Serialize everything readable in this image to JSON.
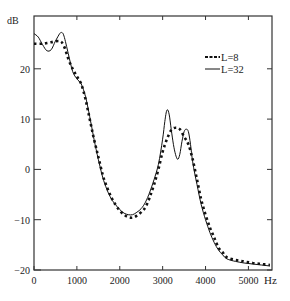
{
  "chart_data": {
    "type": "line",
    "title": "",
    "xlabel": "Hz",
    "ylabel": "dB",
    "xlim": [
      0,
      5550
    ],
    "ylim": [
      -20,
      30.5
    ],
    "x_ticks": [
      0,
      1000,
      2000,
      3000,
      4000,
      5000
    ],
    "x_tick_labels": [
      "0",
      "1000",
      "2000",
      "3000",
      "4000",
      "5000"
    ],
    "y_ticks": [
      -20,
      -10,
      0,
      10,
      20
    ],
    "y_tick_labels": [
      "-20",
      "-10",
      "0",
      "10",
      "20"
    ],
    "grid": false,
    "legend_position": "upper right",
    "series": [
      {
        "name": "L=8",
        "style": "dashed",
        "x": [
          0,
          200,
          400,
          600,
          700,
          800,
          900,
          1000,
          1100,
          1200,
          1300,
          1400,
          1500,
          1600,
          1700,
          1800,
          1900,
          2000,
          2100,
          2200,
          2300,
          2400,
          2500,
          2600,
          2700,
          2800,
          2900,
          3000,
          3100,
          3200,
          3300,
          3400,
          3500,
          3600,
          3700,
          3800,
          3900,
          4000,
          4100,
          4200,
          4300,
          4400,
          4500,
          4700,
          4900,
          5100,
          5300,
          5500
        ],
        "values": [
          25,
          25,
          25.3,
          25.5,
          24.5,
          22,
          20,
          18.5,
          17,
          14,
          10,
          6,
          2.5,
          -1,
          -3.5,
          -5.5,
          -7,
          -8.2,
          -9,
          -9.5,
          -9.6,
          -9.2,
          -8.5,
          -7.5,
          -5.5,
          -3,
          0,
          3.5,
          6,
          7.8,
          8.3,
          8,
          6.5,
          5,
          2,
          -2,
          -6,
          -9,
          -11.5,
          -13.5,
          -15.5,
          -16.5,
          -17.5,
          -18,
          -18.3,
          -18.6,
          -18.8,
          -19
        ]
      },
      {
        "name": "L=32",
        "style": "solid",
        "x": [
          0,
          100,
          200,
          300,
          400,
          500,
          600,
          650,
          700,
          800,
          900,
          1000,
          1100,
          1200,
          1300,
          1400,
          1500,
          1600,
          1700,
          1800,
          1900,
          2000,
          2100,
          2200,
          2300,
          2400,
          2500,
          2600,
          2700,
          2800,
          2900,
          3000,
          3050,
          3100,
          3150,
          3200,
          3250,
          3300,
          3350,
          3400,
          3450,
          3500,
          3550,
          3600,
          3650,
          3700,
          3800,
          3900,
          4000,
          4100,
          4200,
          4300,
          4400,
          4500,
          4700,
          4900,
          5100,
          5300,
          5500
        ],
        "values": [
          27,
          26.3,
          24.8,
          23.6,
          23.8,
          25.5,
          27,
          27.2,
          26.5,
          23,
          19.5,
          18,
          17,
          14.5,
          10.5,
          6,
          2,
          -1.5,
          -4,
          -5.8,
          -7,
          -8,
          -8.7,
          -9,
          -9,
          -8.5,
          -7.8,
          -6.5,
          -4.5,
          -2,
          1,
          6,
          9.5,
          11.8,
          11,
          8,
          5,
          3,
          2,
          3,
          5.5,
          7.5,
          8,
          7.5,
          5,
          1.5,
          -3,
          -7,
          -10,
          -12.5,
          -14.5,
          -16,
          -17,
          -17.8,
          -18.3,
          -18.6,
          -18.8,
          -19,
          -19.2
        ]
      }
    ]
  },
  "axes": {
    "x_unit": "Hz",
    "y_unit": "dB"
  },
  "legend": [
    {
      "label": "L=8",
      "style": "dashed"
    },
    {
      "label": "L=32",
      "style": "solid"
    }
  ]
}
